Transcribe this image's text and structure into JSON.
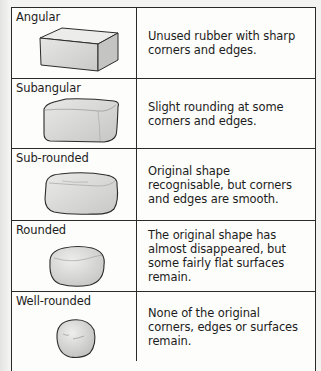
{
  "table": {
    "rows": [
      {
        "label": "Angular",
        "shape_icon": "angular-block",
        "description": "Unused rubber with sharp corners and edges."
      },
      {
        "label": "Subangular",
        "shape_icon": "subangular-block",
        "description": "Slight rounding at some corners and edges."
      },
      {
        "label": "Sub-rounded",
        "shape_icon": "subrounded-block",
        "description": "Original shape recognisable, but corners and edges are smooth."
      },
      {
        "label": "Rounded",
        "shape_icon": "rounded-pebble",
        "description": "The original shape has almost disappeared, but some fairly flat surfaces remain."
      },
      {
        "label": "Well-rounded",
        "shape_icon": "well-rounded-pebble",
        "description": "None of the original corners, edges or surfaces remain."
      }
    ]
  },
  "colors": {
    "border": "#2a2a2a",
    "shape_fill": "#d6d6d4",
    "shape_outline": "#2b2b2b"
  }
}
